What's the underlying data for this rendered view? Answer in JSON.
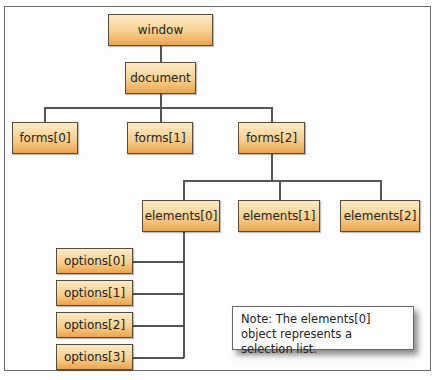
{
  "diagram": {
    "title": "",
    "nodes": {
      "window": "window",
      "document": "document",
      "forms0": "forms[0]",
      "forms1": "forms[1]",
      "forms2": "forms[2]",
      "elements0": "elements[0]",
      "elements1": "elements[1]",
      "elements2": "elements[2]",
      "options0": "options[0]",
      "options1": "options[1]",
      "options2": "options[2]",
      "options3": "options[3]"
    },
    "edges": [
      [
        "window",
        "document"
      ],
      [
        "document",
        "forms[0]"
      ],
      [
        "document",
        "forms[1]"
      ],
      [
        "document",
        "forms[2]"
      ],
      [
        "forms[2]",
        "elements[0]"
      ],
      [
        "forms[2]",
        "elements[1]"
      ],
      [
        "forms[2]",
        "elements[2]"
      ],
      [
        "elements[0]",
        "options[0]"
      ],
      [
        "elements[0]",
        "options[1]"
      ],
      [
        "elements[0]",
        "options[2]"
      ],
      [
        "elements[0]",
        "options[3]"
      ]
    ],
    "note": "Note: The elements[0] object represents a selection list.",
    "colors": {
      "node_top": "#fcebc8",
      "node_bottom": "#eba550",
      "border": "#5a4a3a"
    }
  }
}
